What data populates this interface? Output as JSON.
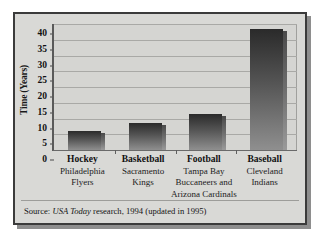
{
  "figure": {
    "source_prefix": "Source:",
    "source_publication": "USA Today",
    "source_rest": "research, 1994 (updated in 1995)"
  },
  "chart_data": {
    "type": "bar",
    "title": "",
    "xlabel": "",
    "ylabel": "Time (Years)",
    "ylim": [
      0,
      40
    ],
    "ytick_step": 5,
    "ytick_labels": [
      "0",
      "5",
      "10",
      "15",
      "20",
      "25",
      "30",
      "35",
      "40"
    ],
    "grid": true,
    "legend": "none",
    "categories": [
      "Hockey",
      "Basketball",
      "Football",
      "Baseball"
    ],
    "category_sublabels": [
      "Philadelphia Flyers",
      "Sacramento Kings",
      "Tampa Bay Buccaneers and Arizona Cardinals",
      "Cleveland Indians"
    ],
    "values": [
      6,
      8.5,
      11.5,
      38.5
    ],
    "bars": [
      {
        "sport": "Hockey",
        "team_line1": "Philadelphia",
        "team_line2": "Flyers",
        "team_line3": "",
        "value": 6
      },
      {
        "sport": "Basketball",
        "team_line1": "Sacramento",
        "team_line2": "Kings",
        "team_line3": "",
        "value": 8.5
      },
      {
        "sport": "Football",
        "team_line1": "Tampa Bay",
        "team_line2": "Buccaneers and",
        "team_line3": "Arizona Cardinals",
        "value": 11.5
      },
      {
        "sport": "Baseball",
        "team_line1": "Cleveland",
        "team_line2": "Indians",
        "team_line3": "",
        "value": 38.5
      }
    ],
    "colors": {
      "plot_background": "#d5d5d2",
      "figure_background": "#d9d9d6",
      "bar_dark": "#2a2a2a",
      "bar_light": "#8f8f8f",
      "gridline": "#a9a9a6",
      "border": "#3b3b3b"
    }
  }
}
